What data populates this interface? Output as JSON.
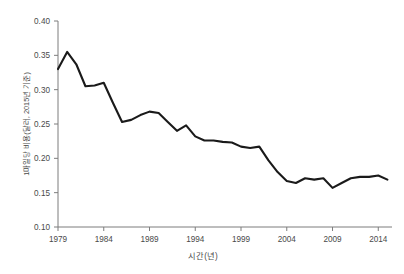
{
  "chart_data": {
    "type": "line",
    "title": "",
    "subtitle": "",
    "xlabel": "시간(년)",
    "ylabel": "1마일당 비용(달러, 2015년 기준)",
    "xlim": [
      1979,
      2015.5
    ],
    "ylim": [
      0.1,
      0.4
    ],
    "grid": false,
    "legend": null,
    "legend_position": "none",
    "line_color": "#1a1a1a",
    "axis_color": "#7d7d7d",
    "text_color": "#4a4a4a",
    "background_color": "#ffffff",
    "xticks": [
      1979,
      1984,
      1989,
      1994,
      1999,
      2004,
      2009,
      2014
    ],
    "xtick_labels": [
      "1979",
      "1984",
      "1989",
      "1994",
      "1999",
      "2004",
      "2009",
      "2014"
    ],
    "yticks": [
      0.1,
      0.15,
      0.2,
      0.25,
      0.3,
      0.35,
      0.4
    ],
    "ytick_labels": [
      "0.10",
      "0.15",
      "0.20",
      "0.25",
      "0.30",
      "0.35",
      "0.40"
    ],
    "series": [
      {
        "name": "1마일당 비용",
        "x": [
          1979,
          1980,
          1981,
          1982,
          1983,
          1984,
          1985,
          1986,
          1987,
          1988,
          1989,
          1990,
          1991,
          1992,
          1993,
          1994,
          1995,
          1996,
          1997,
          1998,
          1999,
          2000,
          2001,
          2002,
          2003,
          2004,
          2005,
          2006,
          2007,
          2008,
          2009,
          2010,
          2011,
          2012,
          2013,
          2014,
          2015
        ],
        "values": [
          0.33,
          0.355,
          0.337,
          0.305,
          0.306,
          0.31,
          0.281,
          0.253,
          0.256,
          0.263,
          0.268,
          0.266,
          0.253,
          0.24,
          0.248,
          0.232,
          0.226,
          0.226,
          0.224,
          0.223,
          0.217,
          0.215,
          0.217,
          0.197,
          0.18,
          0.167,
          0.164,
          0.171,
          0.169,
          0.171,
          0.157,
          0.164,
          0.171,
          0.173,
          0.173,
          0.175,
          0.169
        ]
      }
    ]
  }
}
